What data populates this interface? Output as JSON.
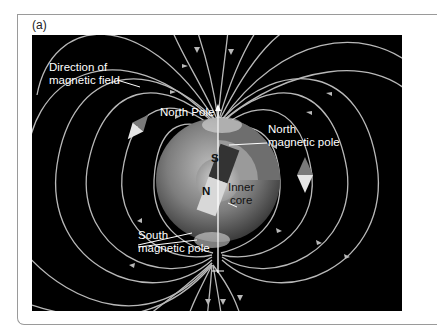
{
  "figure": {
    "panel_label": "(a)",
    "labels": {
      "direction_line1": "Direction of",
      "direction_line2": "magnetic field",
      "north_pole": "North Pole",
      "north_magnetic_line1": "North",
      "north_magnetic_line2": "magnetic pole",
      "south_magnetic_line1": "South",
      "south_magnetic_line2": "magnetic pole",
      "inner_core_line1": "Inner",
      "inner_core_line2": "core",
      "magnet_s": "S",
      "magnet_n": "N",
      "compass_letter": "N"
    },
    "colors": {
      "background": "#000000",
      "field_lines": "#b9b9b9",
      "earth": "#8a8a8a",
      "text": "#ffffff",
      "border": "#9a9a9a"
    }
  }
}
